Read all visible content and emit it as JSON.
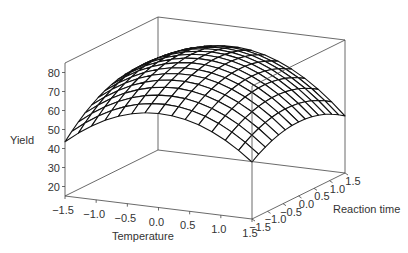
{
  "chart_data": {
    "type": "surface3d",
    "title": "",
    "xlabel": "Temperature",
    "ylabel": "Reaction time",
    "zlabel": "Yield",
    "x_ticks": [
      "-1.5",
      "-1.0",
      "-0.5",
      "0.0",
      "0.5",
      "1.0",
      "1.5"
    ],
    "y_ticks": [
      "-1.5",
      "-1.0",
      "-0.5",
      "0.0",
      "0.5",
      "1.0",
      "1.5"
    ],
    "z_ticks": [
      "20",
      "30",
      "40",
      "50",
      "60",
      "70",
      "80"
    ],
    "xlim": [
      -1.5,
      1.5
    ],
    "ylim": [
      -1.5,
      1.5
    ],
    "zlim": [
      15,
      85
    ],
    "grid_lines": 14,
    "model": {
      "description": "quadratic response surface, Yield = b0 + b1*T + b2*R + b11*T^2 + b22*R^2 + b12*T*R",
      "b0": 78,
      "b1": -2.5,
      "b2": 3.0,
      "b11": -9.0,
      "b22": -4.0,
      "b12": -2.0
    },
    "approx_values": {
      "T=-1.5,R=-1.5": 52,
      "T=0,R=0": 78,
      "T=1.5,R=-1.5": 42,
      "T=1.5,R=1.5": 48,
      "T=-1.5,R=1.5": 62
    },
    "box": true,
    "legend": "none"
  }
}
